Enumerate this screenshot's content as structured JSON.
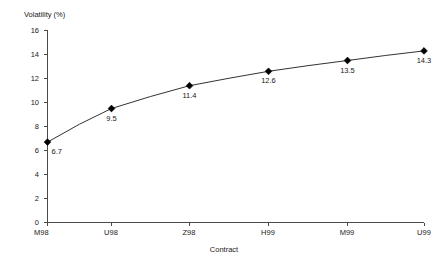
{
  "chart_data": {
    "type": "line",
    "title": "",
    "xlabel": "Contract",
    "ylabel": "Volatility (%)",
    "categories": [
      "M98",
      "U98",
      "Z98",
      "H99",
      "M99",
      "U99"
    ],
    "values": [
      6.7,
      9.5,
      11.4,
      12.6,
      13.5,
      14.3
    ],
    "point_labels": [
      "6.7",
      "9.5",
      "11.4",
      "12.6",
      "13.5",
      "14.3"
    ],
    "series": [
      {
        "name": "Volatility (%)",
        "values": [
          6.7,
          9.5,
          11.4,
          12.6,
          13.5,
          14.3
        ]
      }
    ],
    "ylim": [
      0,
      16
    ],
    "y_ticks": [
      0,
      2,
      4,
      6,
      8,
      10,
      12,
      14,
      16
    ],
    "y_tick_labels": [
      "0",
      "2",
      "4",
      "6",
      "8",
      "10",
      "12",
      "14",
      "16"
    ],
    "grid": false,
    "legend": "none",
    "marker": "diamond",
    "line_color": "#333333",
    "marker_color": "#000000",
    "axis_color": "#4a4a4a",
    "background": "#ffffff"
  },
  "axes": {
    "y_axis_title": "Volatility (%)",
    "x_axis_title": "Contract"
  }
}
